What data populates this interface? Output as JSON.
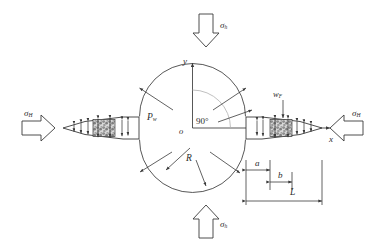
{
  "figure": {
    "kind": "hydraulic-fracture-mechanics-schematic",
    "background_color": "#ffffff",
    "line_color": "#3a3a3a",
    "text_color": "#2b2b2b",
    "proppant_fill": "#b9b9b9"
  },
  "axes": {
    "y_label": "y",
    "x_label": "x",
    "origin_label": "o"
  },
  "wellbore": {
    "radius_label": "R",
    "pressure_label": "P",
    "pressure_sub": "w",
    "angle_label": "90°"
  },
  "stresses": {
    "top": {
      "symbol": "σ",
      "sub": "h"
    },
    "bottom": {
      "symbol": "σ",
      "sub": "h"
    },
    "left": {
      "symbol": "σ",
      "sub": "H"
    },
    "right": {
      "symbol": "σ",
      "sub": "H"
    }
  },
  "fracture": {
    "width_label": "w",
    "width_sub": "F"
  },
  "dimensions": [
    {
      "name": "a",
      "label": "a"
    },
    {
      "name": "b",
      "label": "b"
    },
    {
      "name": "L",
      "label": "L"
    }
  ]
}
